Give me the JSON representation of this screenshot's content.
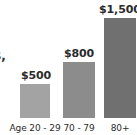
{
  "chart_data": {
    "type": "bar",
    "title": "",
    "subtitle": "",
    "xlabel": "",
    "ylabel": "",
    "categories": [
      "Age 20 - 29",
      "70 - 79",
      "80+"
    ],
    "values": [
      500,
      800,
      1500
    ],
    "value_labels": [
      "$500",
      "$800",
      "$1,500"
    ],
    "ylim": [
      0,
      1500
    ],
    "grid": false,
    "legend": null,
    "annotations": [
      {
        "name": "clipped-left-text",
        "text": "$,",
        "note": "partially cropped text at left edge of image"
      }
    ],
    "series": [
      {
        "name": "Cost",
        "values": [
          500,
          800,
          1500
        ],
        "colors": [
          "#a3a3a3",
          "#8c8c8c",
          "#707070"
        ]
      }
    ]
  },
  "chart": {
    "bars": [
      {
        "label": "Age 20 - 29",
        "value_label": "$500",
        "color": "#a3a3a3"
      },
      {
        "label": "70 - 79",
        "value_label": "$800",
        "color": "#8c8c8c"
      },
      {
        "label": "80+",
        "value_label": "$1,500",
        "color": "#707070"
      }
    ],
    "clipped_text": "$,"
  }
}
